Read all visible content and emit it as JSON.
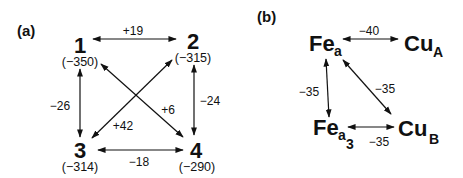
{
  "panel_a": {
    "label": "(a)",
    "nodes": [
      {
        "id": "1",
        "label": "1",
        "value": "(−350)"
      },
      {
        "id": "2",
        "label": "2",
        "value": "(−315)"
      },
      {
        "id": "3",
        "label": "3",
        "value": "(−314)"
      },
      {
        "id": "4",
        "label": "4",
        "value": "(−290)"
      }
    ],
    "edges": [
      {
        "from": "1",
        "to": "2",
        "label": "+19"
      },
      {
        "from": "1",
        "to": "3",
        "label": "−26"
      },
      {
        "from": "2",
        "to": "4",
        "label": "−24"
      },
      {
        "from": "1",
        "to": "4",
        "label": "+6"
      },
      {
        "from": "2",
        "to": "3",
        "label": "+42"
      },
      {
        "from": "3",
        "to": "4",
        "label": "−18"
      }
    ]
  },
  "panel_b": {
    "label": "(b)",
    "nodes": [
      {
        "id": "Fea",
        "base": "Fe",
        "sub": "a",
        "subsub": ""
      },
      {
        "id": "CuA",
        "base": "Cu",
        "sub": "A",
        "subsub": ""
      },
      {
        "id": "Fea3",
        "base": "Fe",
        "sub": "a",
        "subsub": "3"
      },
      {
        "id": "CuB",
        "base": "Cu",
        "sub": "B",
        "subsub": ""
      }
    ],
    "edges": [
      {
        "from": "Fea",
        "to": "CuA",
        "label": "−40"
      },
      {
        "from": "Fea",
        "to": "Fea3",
        "label": "−35"
      },
      {
        "from": "Fea",
        "to": "CuB",
        "label": "−35"
      },
      {
        "from": "Fea3",
        "to": "CuB",
        "label": "−35"
      }
    ]
  }
}
